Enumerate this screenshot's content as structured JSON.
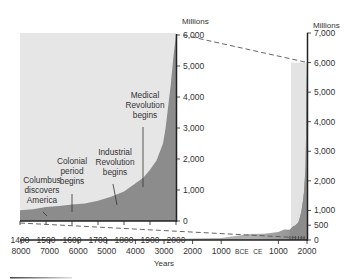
{
  "chart_data": [
    {
      "name": "main",
      "type": "area",
      "title": "",
      "xlabel": "Years",
      "ylabel": "Millions",
      "x_ticks": [
        "8000",
        "7000",
        "6000",
        "5000",
        "4000",
        "3000",
        "2000",
        "1000",
        "BCE",
        "CE",
        "1000",
        "2000"
      ],
      "x_tick_values": [
        -8000,
        -7000,
        -6000,
        -5000,
        -4000,
        -3000,
        -2000,
        -1000,
        0,
        0,
        1000,
        2000
      ],
      "y_ticks": [
        "0",
        "500",
        "1,000",
        "2,000",
        "3,000",
        "4,000",
        "5,000",
        "6,000",
        "7,000"
      ],
      "y_tick_values": [
        0,
        500,
        1000,
        2000,
        3000,
        4000,
        5000,
        6000,
        7000
      ],
      "xlim": [
        -8000,
        2000
      ],
      "ylim": [
        0,
        7000
      ],
      "series": [
        {
          "name": "World population",
          "x": [
            -8000,
            -5000,
            -3000,
            -1000,
            0,
            500,
            1000,
            1200,
            1400,
            1500,
            1600,
            1700,
            1750,
            1800,
            1850,
            1900,
            1950,
            1970,
            1990,
            2000
          ],
          "values": [
            5,
            15,
            30,
            70,
            200,
            210,
            275,
            360,
            350,
            450,
            500,
            600,
            750,
            950,
            1250,
            1650,
            2500,
            3700,
            5300,
            6000
          ]
        }
      ],
      "highlight_band": {
        "from": 1800,
        "to": 2000
      }
    },
    {
      "name": "inset",
      "type": "area",
      "title": "",
      "xlabel": "",
      "ylabel": "Millions",
      "x_ticks": [
        "1400",
        "1500",
        "1600",
        "1700",
        "1800",
        "1900",
        "2000"
      ],
      "x_tick_values": [
        1400,
        1500,
        1600,
        1700,
        1800,
        1900,
        2000
      ],
      "y_ticks": [
        "0",
        "1,000",
        "2,000",
        "3,000",
        "4,000",
        "5,000",
        "6,000"
      ],
      "y_tick_values": [
        0,
        1000,
        2000,
        3000,
        4000,
        5000,
        6000
      ],
      "xlim": [
        1400,
        2000
      ],
      "ylim": [
        0,
        6000
      ],
      "series": [
        {
          "name": "World population",
          "x": [
            1400,
            1450,
            1500,
            1550,
            1600,
            1650,
            1700,
            1750,
            1800,
            1850,
            1875,
            1900,
            1925,
            1950,
            1960,
            1970,
            1980,
            1990,
            2000
          ],
          "values": [
            350,
            380,
            450,
            480,
            530,
            560,
            650,
            780,
            950,
            1250,
            1400,
            1650,
            1950,
            2500,
            3000,
            3700,
            4400,
            5300,
            6000
          ]
        }
      ],
      "annotations": [
        {
          "lines": [
            "Columbus",
            "discovers",
            "America"
          ],
          "year": 1492
        },
        {
          "lines": [
            "Colonial",
            "period",
            "begins"
          ],
          "year": 1600
        },
        {
          "lines": [
            "Industrial",
            "Revolution",
            "begins"
          ],
          "year": 1775
        },
        {
          "lines": [
            "Medical",
            "Revolution",
            "begins"
          ],
          "year": 1875
        }
      ]
    }
  ],
  "colors": {
    "area_dark": "#8c8c8c",
    "panel_bg": "#e6e6e6",
    "band_light": "#e3e3e3",
    "axis": "#222222",
    "dash": "#555555"
  }
}
